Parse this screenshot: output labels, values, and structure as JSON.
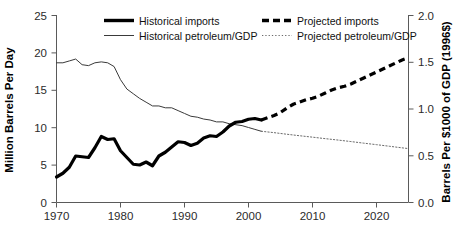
{
  "chart_data": {
    "type": "line",
    "title": "",
    "xlabel": "",
    "ylabel": "Million Barrels Per Day",
    "y2label": "Barrels Per $1000 of GDP (1996$)",
    "xlim": [
      1970,
      2025
    ],
    "ylim": [
      0,
      25
    ],
    "y2lim": [
      0.0,
      2.0
    ],
    "grid": false,
    "legend_position": "top-inside",
    "x_ticks": [
      1970,
      1980,
      1990,
      2000,
      2010,
      2020
    ],
    "x_tick_labels": [
      "1970",
      "1980",
      "1990",
      "2000",
      "2010",
      "2020"
    ],
    "y_ticks": [
      0,
      5,
      10,
      15,
      20,
      25
    ],
    "y_tick_labels": [
      "0",
      "5",
      "10",
      "15",
      "20",
      "25"
    ],
    "y2_ticks": [
      0.0,
      0.5,
      1.0,
      1.5,
      2.0
    ],
    "y2_tick_labels": [
      "0.0",
      "0.5",
      "1.0",
      "1.5",
      "2.0"
    ],
    "series": [
      {
        "name": "Historical imports",
        "axis": "left",
        "style": "solid-thick",
        "color": "#000000",
        "x": [
          1970,
          1971,
          1972,
          1973,
          1974,
          1975,
          1976,
          1977,
          1978,
          1979,
          1980,
          1981,
          1982,
          1983,
          1984,
          1985,
          1986,
          1987,
          1988,
          1989,
          1990,
          1991,
          1992,
          1993,
          1994,
          1995,
          1996,
          1997,
          1998,
          1999,
          2000,
          2001,
          2002
        ],
        "values": [
          3.4,
          3.9,
          4.7,
          6.2,
          6.1,
          6.0,
          7.3,
          8.8,
          8.4,
          8.5,
          6.9,
          6.0,
          5.1,
          5.0,
          5.4,
          4.9,
          6.2,
          6.7,
          7.4,
          8.1,
          8.0,
          7.6,
          7.9,
          8.6,
          8.9,
          8.8,
          9.4,
          10.2,
          10.7,
          10.8,
          11.1,
          11.2,
          11.0
        ]
      },
      {
        "name": "Projected imports",
        "axis": "left",
        "style": "dashed-thick",
        "color": "#000000",
        "x": [
          2002,
          2003,
          2004,
          2005,
          2006,
          2007,
          2008,
          2009,
          2010,
          2011,
          2012,
          2013,
          2014,
          2015,
          2016,
          2017,
          2018,
          2019,
          2020,
          2021,
          2022,
          2023,
          2024,
          2025
        ],
        "values": [
          11.0,
          11.3,
          11.6,
          12.0,
          12.6,
          13.1,
          13.4,
          13.7,
          13.9,
          14.2,
          14.6,
          15.0,
          15.3,
          15.5,
          15.8,
          16.2,
          16.6,
          17.0,
          17.4,
          17.8,
          18.2,
          18.6,
          19.0,
          19.3
        ]
      },
      {
        "name": "Historical petroleum/GDP",
        "axis": "right",
        "style": "solid-thin",
        "color": "#3a3a3a",
        "x": [
          1970,
          1971,
          1972,
          1973,
          1974,
          1975,
          1976,
          1977,
          1978,
          1979,
          1980,
          1981,
          1982,
          1983,
          1984,
          1985,
          1986,
          1987,
          1988,
          1989,
          1990,
          1991,
          1992,
          1993,
          1994,
          1995,
          1996,
          1997,
          1998,
          1999,
          2000,
          2001,
          2002
        ],
        "values": [
          1.49,
          1.49,
          1.51,
          1.53,
          1.47,
          1.46,
          1.49,
          1.5,
          1.49,
          1.45,
          1.31,
          1.21,
          1.16,
          1.11,
          1.07,
          1.03,
          1.03,
          1.01,
          1.01,
          0.98,
          0.95,
          0.92,
          0.91,
          0.89,
          0.88,
          0.86,
          0.86,
          0.84,
          0.83,
          0.82,
          0.8,
          0.78,
          0.76
        ]
      },
      {
        "name": "Projected petroleum/GDP",
        "axis": "right",
        "style": "dotted-thin",
        "color": "#6b6b6b",
        "x": [
          2002,
          2004,
          2006,
          2008,
          2010,
          2012,
          2014,
          2016,
          2018,
          2020,
          2022,
          2024,
          2025
        ],
        "values": [
          0.76,
          0.745,
          0.728,
          0.712,
          0.697,
          0.681,
          0.666,
          0.65,
          0.633,
          0.617,
          0.6,
          0.583,
          0.575
        ]
      }
    ]
  },
  "axes": {
    "left_title": "Million Barrels Per Day",
    "right_title": "Barrels Per $1000 of GDP (1996$)"
  },
  "legend": {
    "items": [
      {
        "label": "Historical imports",
        "swatch": "solid-thick"
      },
      {
        "label": "Projected imports",
        "swatch": "dashed-thick"
      },
      {
        "label": "Historical petroleum/GDP",
        "swatch": "solid-thin"
      },
      {
        "label": "Projected petroleum/GDP",
        "swatch": "dotted-thin"
      }
    ]
  },
  "ticks": {
    "y_left": [
      "25",
      "20",
      "15",
      "10",
      "5",
      "0"
    ],
    "y_right": [
      "2.0",
      "1.5",
      "1.0",
      "0.5",
      "0.0"
    ],
    "x": [
      "1970",
      "1980",
      "1990",
      "2000",
      "2010",
      "2020"
    ]
  }
}
